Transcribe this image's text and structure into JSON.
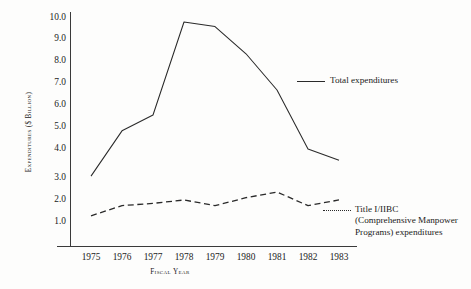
{
  "chart_data": {
    "type": "line",
    "title": "",
    "xlabel": "Fiscal Year",
    "ylabel": "Expenditures ($ Billion)",
    "categories": [
      "1975",
      "1976",
      "1977",
      "1978",
      "1979",
      "1980",
      "1981",
      "1982",
      "1983"
    ],
    "x": [
      1975,
      1976,
      1977,
      1978,
      1979,
      1980,
      1981,
      1982,
      1983
    ],
    "ylim": [
      0,
      10
    ],
    "yticks": [
      "10.0",
      "9.0",
      "8.0",
      "7.0",
      "6.0",
      "5.0",
      "4.0",
      "3.0",
      "2.0",
      "1.0"
    ],
    "ytick_values": [
      10.0,
      9.0,
      8.0,
      7.0,
      6.0,
      5.0,
      4.0,
      3.0,
      2.0,
      1.0
    ],
    "grid": false,
    "legend_position": "inside-right",
    "series": [
      {
        "name": "Total expenditures",
        "style": "solid",
        "color": "#2a2a2a",
        "values": [
          3.0,
          5.0,
          5.7,
          9.8,
          9.6,
          8.4,
          6.8,
          4.2,
          3.7
        ]
      },
      {
        "name": "Title I/IIBC (Comprehensive Manpower Programs) expenditures",
        "style": "dashed",
        "color": "#2a2a2a",
        "values": [
          1.25,
          1.7,
          1.8,
          1.95,
          1.7,
          2.05,
          2.3,
          1.7,
          1.95
        ]
      }
    ]
  },
  "axis": {
    "y_title": "Expenditures ($ Billion)",
    "x_title": "Fiscal Year"
  },
  "legend": {
    "total_label": "Total expenditures",
    "title1_line1": "Title I/IIBC",
    "title1_line2": "(Comprehensive Manpower",
    "title1_line3": "Programs) expenditures"
  }
}
